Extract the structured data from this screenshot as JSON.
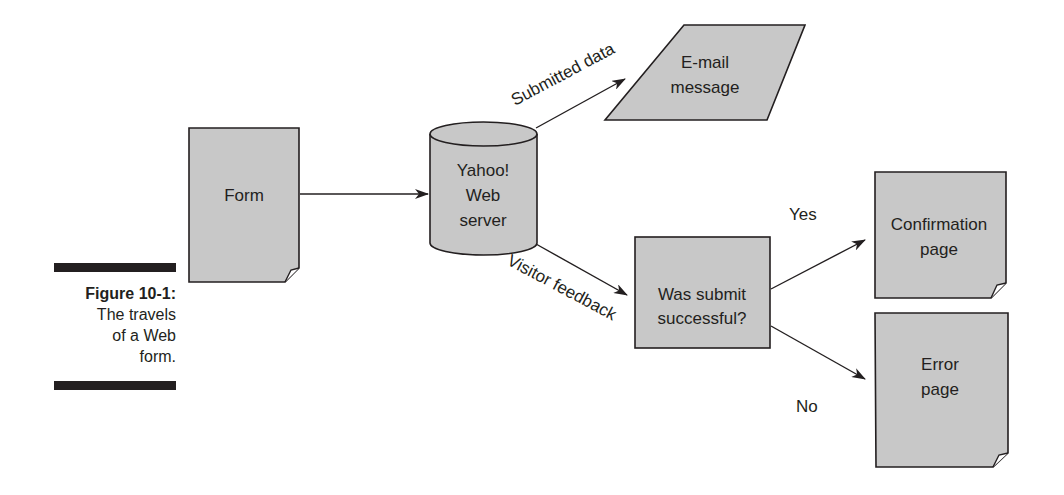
{
  "figure": {
    "label": "Figure 10-1:",
    "caption": "The travels of a Web form.",
    "caption_lines": [
      "The travels",
      "of a Web",
      "form."
    ]
  },
  "colors": {
    "shape_fill": "#c8c8c8",
    "stroke": "#231f20",
    "text": "#231f20",
    "background": "#ffffff"
  },
  "nodes": {
    "form": {
      "label": "Form",
      "shape": "document"
    },
    "server": {
      "label_lines": [
        "Yahoo!",
        "Web",
        "server"
      ],
      "shape": "cylinder"
    },
    "email": {
      "label_lines": [
        "E-mail",
        "message"
      ],
      "shape": "parallelogram"
    },
    "decision": {
      "label_lines": [
        "Was submit",
        "successful?"
      ],
      "shape": "rectangle"
    },
    "confirmation": {
      "label_lines": [
        "Confirmation",
        "page"
      ],
      "shape": "document"
    },
    "error": {
      "label_lines": [
        "Error",
        "page"
      ],
      "shape": "document"
    }
  },
  "edges": {
    "form_to_server": {
      "label": ""
    },
    "server_to_email": {
      "label": "Submitted data"
    },
    "server_to_decision": {
      "label": "Visitor feedback"
    },
    "decision_to_confirmation": {
      "label": "Yes"
    },
    "decision_to_error": {
      "label": "No"
    }
  }
}
